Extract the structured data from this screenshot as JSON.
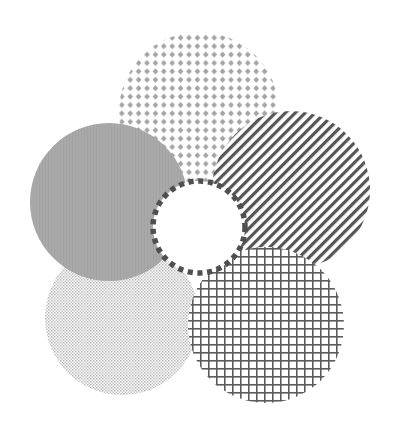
{
  "diagram": {
    "type": "overlapping-patterned-circles",
    "background": "#ffffff",
    "circles": [
      {
        "id": "top",
        "pattern": "dot-grid",
        "cx": 199,
        "cy": 112,
        "r": 80,
        "color": "#a0a0a0"
      },
      {
        "id": "right",
        "pattern": "diagonal-stripes",
        "cx": 291,
        "cy": 190,
        "r": 79,
        "color": "#555555"
      },
      {
        "id": "left",
        "pattern": "solid",
        "cx": 109,
        "cy": 202,
        "r": 79,
        "color": "#a8a8a8"
      },
      {
        "id": "bottom-left",
        "pattern": "fine-stipple",
        "cx": 122,
        "cy": 318,
        "r": 77,
        "color": "#b4b4b4"
      },
      {
        "id": "bottom-right",
        "pattern": "square-grid",
        "cx": 266,
        "cy": 325,
        "r": 78,
        "color": "#5a5a5a"
      },
      {
        "id": "center",
        "pattern": "dashed-outline",
        "cx": 199,
        "cy": 227,
        "r": 46,
        "color": "#4f4f4f",
        "fill": "#ffffff"
      }
    ]
  }
}
